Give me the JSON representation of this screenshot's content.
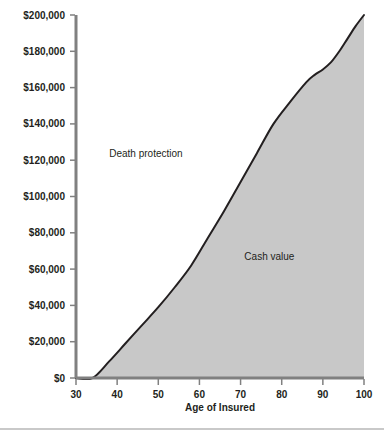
{
  "chart_data": {
    "type": "area",
    "title": "",
    "subtitle": "",
    "xlabel": "Age of Insured",
    "ylabel": "",
    "xlim": [
      30,
      100
    ],
    "ylim": [
      0,
      200000
    ],
    "grid": false,
    "legend_position": "inline-annotations",
    "x_ticks": [
      30,
      40,
      50,
      60,
      70,
      80,
      90,
      100
    ],
    "x_tick_labels": [
      "30",
      "40",
      "50",
      "60",
      "70",
      "80",
      "90",
      "100"
    ],
    "y_ticks": [
      0,
      20000,
      40000,
      60000,
      80000,
      100000,
      120000,
      140000,
      160000,
      180000,
      200000
    ],
    "y_tick_labels": [
      "$0",
      "$20,000",
      "$40,000",
      "$60,000",
      "$80,000",
      "$100,000",
      "$120,000",
      "$140,000",
      "$160,000",
      "$180,000",
      "$200,000"
    ],
    "series": [
      {
        "name": "Cash value",
        "fill_color": "#c8c8c8",
        "line_color": "#231f20",
        "x": [
          30,
          34,
          38,
          42,
          46,
          50,
          54,
          58,
          62,
          66,
          70,
          74,
          78,
          82,
          86,
          88,
          90,
          92,
          94,
          96,
          98,
          100
        ],
        "values": [
          0,
          0,
          9000,
          19000,
          29000,
          39000,
          50000,
          62000,
          77000,
          92000,
          108000,
          124000,
          140000,
          152000,
          163000,
          167000,
          170000,
          174000,
          180000,
          187000,
          194000,
          200000
        ]
      }
    ],
    "annotations": [
      {
        "text": "Death protection",
        "x": 47,
        "y": 122000,
        "region": "above-curve"
      },
      {
        "text": "Cash value",
        "x": 77,
        "y": 65000,
        "region": "below-curve"
      }
    ],
    "axis_color": "#808080",
    "background_color": "#ffffff"
  }
}
